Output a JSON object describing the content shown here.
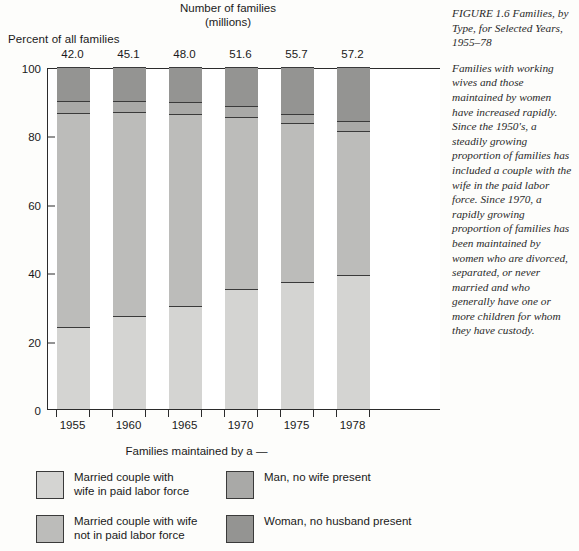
{
  "figure": {
    "caption_heading": "FIGURE 1.6\nFamilies, by Type, for Selected Years, 1955–78",
    "caption_body": "Families with working wives and those maintained by women have increased rapidly. Since the 1950's, a steadily growing proportion of families has included a couple with the wife in the paid labor force. Since 1970, a rapidly growing proportion of families has been maintained by women who are divorced, separated, or never married and who generally have one or more children for whom they have custody."
  },
  "labels": {
    "y_axis_title": "Percent of all families",
    "top_axis_title": "Number of\nfamilies\n(millions)",
    "legend_title": "Families maintained by a —"
  },
  "legend": {
    "items": [
      {
        "key": "married-wife-in-labor-force",
        "label": "Married couple with\nwife in paid labor force",
        "color": "#d4d4d2"
      },
      {
        "key": "married-wife-not-in-labor-force",
        "label": "Married couple with wife\nnot in paid labor force",
        "color": "#bcbcba"
      },
      {
        "key": "man-no-wife-present",
        "label": "Man, no wife present",
        "color": "#a9a9a7"
      },
      {
        "key": "woman-no-husband-present",
        "label": "Woman, no husband present",
        "color": "#949492"
      }
    ]
  },
  "chart_data": {
    "type": "bar",
    "title": "Families, by Type, for Selected Years, 1955–78",
    "xlabel": "",
    "ylabel": "Percent of all families",
    "ylim": [
      0,
      100
    ],
    "yticks": [
      0,
      20,
      40,
      60,
      80,
      100
    ],
    "grid": false,
    "stacked": true,
    "normalized_percent": true,
    "legend_position": "bottom",
    "categories": [
      "1955",
      "1960",
      "1965",
      "1970",
      "1975",
      "1978"
    ],
    "top_labels": [
      "42.0",
      "45.1",
      "48.0",
      "51.6",
      "55.7",
      "57.2"
    ],
    "top_labels_units": "millions of families",
    "series": [
      {
        "name": "Married couple with wife in paid labor force",
        "color": "#d4d4d2",
        "values": [
          24.0,
          27.3,
          30.2,
          35.2,
          37.1,
          39.1
        ]
      },
      {
        "name": "Married couple with wife not in paid labor force",
        "color": "#bcbcba",
        "values": [
          62.5,
          59.6,
          56.2,
          50.3,
          46.5,
          42.2
        ]
      },
      {
        "name": "Man, no wife present",
        "color": "#a9a9a7",
        "values": [
          3.5,
          3.3,
          3.3,
          3.0,
          2.8,
          2.9
        ]
      },
      {
        "name": "Woman, no husband present",
        "color": "#949492",
        "values": [
          10.0,
          9.8,
          10.3,
          11.5,
          13.6,
          15.8
        ]
      }
    ]
  }
}
